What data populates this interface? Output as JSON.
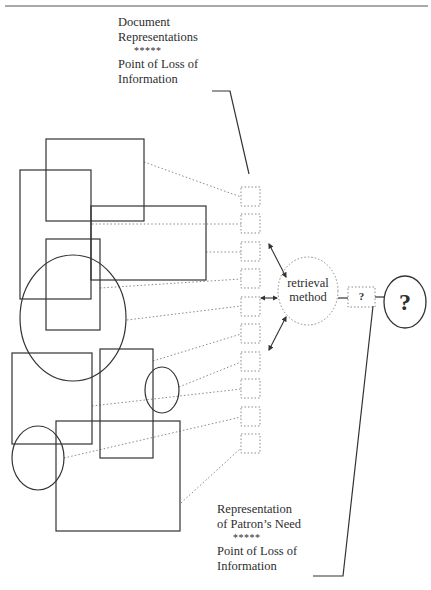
{
  "colors": {
    "ink": "#333333",
    "dotted": "#8a8a8a",
    "background": "#ffffff"
  },
  "top_label": {
    "line1": "Document",
    "line2": "Representations",
    "stars": "*****",
    "line3": "Point of Loss of",
    "line4": "Information"
  },
  "bottom_label": {
    "line1": "Representation",
    "line2": "of Patron’s Need",
    "stars": "*****",
    "line3": "Point of Loss of",
    "line4": "Information"
  },
  "retrieval": {
    "line1": "retrieval",
    "line2": "method"
  },
  "query_box": {
    "label": "?"
  },
  "patron": {
    "label": "?"
  },
  "document_shapes": [
    {
      "type": "rect",
      "x": 46,
      "y": 139,
      "w": 98,
      "h": 82
    },
    {
      "type": "rect",
      "x": 20,
      "y": 170,
      "w": 71,
      "h": 129
    },
    {
      "type": "rect",
      "x": 91,
      "y": 206,
      "w": 115,
      "h": 74
    },
    {
      "type": "rect",
      "x": 46,
      "y": 239,
      "w": 54,
      "h": 91
    },
    {
      "type": "ellipse",
      "cx": 73,
      "cy": 318,
      "rx": 53,
      "ry": 63
    },
    {
      "type": "rect",
      "x": 12,
      "y": 353,
      "w": 80,
      "h": 91
    },
    {
      "type": "rect",
      "x": 100,
      "y": 349,
      "w": 53,
      "h": 109
    },
    {
      "type": "ellipse",
      "cx": 162,
      "cy": 390,
      "rx": 17,
      "ry": 23
    },
    {
      "type": "rect",
      "x": 56,
      "y": 421,
      "w": 124,
      "h": 110
    },
    {
      "type": "ellipse",
      "cx": 38,
      "cy": 458,
      "rx": 26,
      "ry": 32
    }
  ],
  "representation_squares": [
    187,
    214,
    242,
    269,
    297,
    324,
    352,
    379,
    407,
    434
  ],
  "connectors": [
    [
      144,
      162,
      241,
      197
    ],
    [
      92,
      224,
      241,
      224
    ],
    [
      206,
      252,
      241,
      252
    ],
    [
      100,
      288,
      241,
      279
    ],
    [
      127,
      320,
      241,
      306
    ],
    [
      153,
      361,
      241,
      334
    ],
    [
      179,
      387,
      241,
      362
    ],
    [
      92,
      406,
      241,
      389
    ],
    [
      64,
      458,
      241,
      417
    ],
    [
      181,
      503,
      241,
      448
    ]
  ]
}
